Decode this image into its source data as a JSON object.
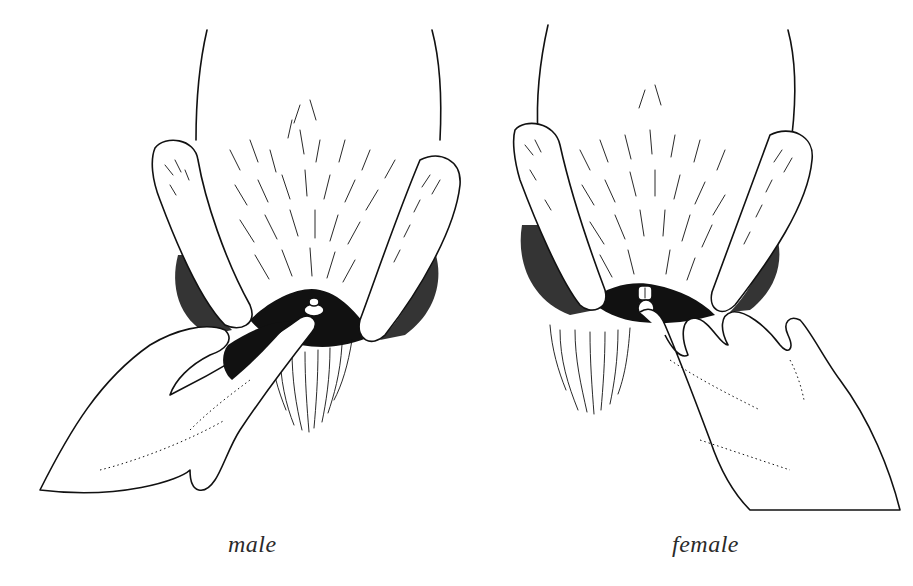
{
  "figure": {
    "panels": [
      {
        "id": "male",
        "caption": "male",
        "description": "Line drawing: rabbit underside with hind legs held apart; finger presses to expose male genitalia"
      },
      {
        "id": "female",
        "caption": "female",
        "description": "Line drawing: rabbit underside with hind legs held apart; finger presses to expose female genitalia"
      }
    ],
    "colors": {
      "ink": "#111111",
      "background": "#ffffff",
      "caption": "#2a2a2a"
    }
  }
}
